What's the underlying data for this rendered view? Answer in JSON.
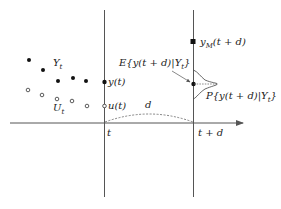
{
  "diagram": {
    "type": "prediction-timeline",
    "colors": {
      "line": "#555555",
      "point": "#111111",
      "dashed": "#666666"
    },
    "axis": {
      "label_t": "t",
      "label_td": "t + d",
      "span_label": "d"
    },
    "labels": {
      "output_set": "Y",
      "output_set_sub": "t",
      "input_set": "U",
      "input_set_sub": "t",
      "y_now": "y(t)",
      "u_now": "u(t)",
      "model_pred": "y",
      "model_pred_sub": "M",
      "model_pred_arg": "(t + d)",
      "expectation": "E{y(t + d)|Y",
      "expectation_sub": "t",
      "expectation_close": "}",
      "distribution": "P{y(t + d)|Y",
      "distribution_sub": "t",
      "distribution_close": "}"
    },
    "outputs_filled": [
      [
        29,
        60
      ],
      [
        43,
        70
      ],
      [
        58,
        81
      ],
      [
        73,
        78
      ],
      [
        86,
        81
      ]
    ],
    "inputs_hollow": [
      [
        28,
        90
      ],
      [
        42,
        95
      ],
      [
        57,
        99
      ],
      [
        72,
        101
      ],
      [
        88,
        106
      ]
    ],
    "y_t_point": [
      104,
      82
    ],
    "u_t_point": [
      104,
      106
    ],
    "y_model_point": [
      193,
      42
    ],
    "expectation_point": [
      193,
      84
    ]
  }
}
